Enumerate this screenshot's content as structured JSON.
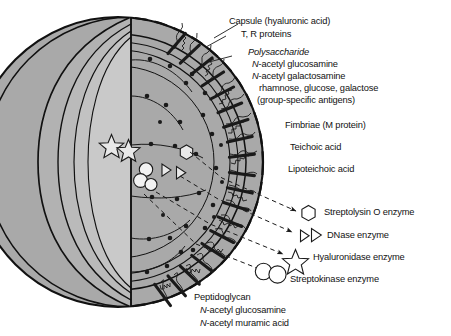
{
  "figure": {
    "background_color": "#ffffff",
    "line_color": "#1a1a1a"
  },
  "cell": {
    "layers": [
      {
        "name": "outer-capsule-shell",
        "color": "#a9a9a9"
      },
      {
        "name": "cell-wall-layer",
        "color": "#b4b4b4"
      },
      {
        "name": "inner-membrane-layer",
        "color": "#bfbfbf"
      },
      {
        "name": "cytoplasm",
        "color": "#c9c9c9"
      }
    ]
  },
  "labels": {
    "capsule": "Capsule (hyaluronic acid)",
    "tr_proteins": "T, R proteins",
    "polysaccharide_heading": "Polysaccharide",
    "polysaccharide_items": [
      {
        "prefix": "N",
        "rest": "-acetyl glucosamine"
      },
      {
        "prefix": "N",
        "rest": "-acetyl galactosamine"
      }
    ],
    "polysaccharide_sugars": "rhamnose, glucose, galactose",
    "polysaccharide_antigens": "(group-specific antigens)",
    "fimbriae": "Fimbriae (M protein)",
    "teichoic_acid": "Teichoic acid",
    "lipoteichoic_acid": "Lipoteichoic acid",
    "peptidoglycan_heading": "Peptidoglycan",
    "peptidoglycan_items": [
      {
        "prefix": "N",
        "rest": "-acetyl glucosamine"
      },
      {
        "prefix": "N",
        "rest": "-acetyl muramic acid"
      }
    ]
  },
  "enzymes": [
    {
      "symbol": "hexagon-icon",
      "label": "Streptolysin O enzyme"
    },
    {
      "symbol": "double-triangle-icon",
      "label": "DNase enzyme"
    },
    {
      "symbol": "star-icon",
      "label": "Hyaluronidase enzyme"
    },
    {
      "symbol": "double-circle-icon",
      "label": "Streptokinase enzyme"
    }
  ]
}
